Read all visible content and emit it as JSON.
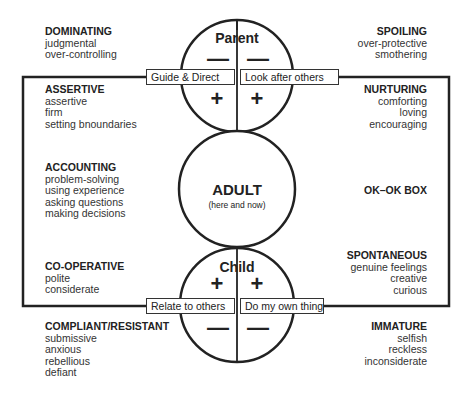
{
  "parent": {
    "label": "Parent",
    "left_label": "Guide & Direct",
    "right_label": "Look after others",
    "top_left_sign": "—",
    "top_right_sign": "—",
    "bottom_left_sign": "+",
    "bottom_right_sign": "+"
  },
  "adult": {
    "label": "ADULT",
    "sublabel": "(here and now)"
  },
  "child": {
    "label": "Child",
    "left_label": "Relate to others",
    "right_label": "Do my own thing",
    "top_left_sign": "+",
    "top_right_sign": "+",
    "bottom_left_sign": "—",
    "bottom_right_sign": "—"
  },
  "box_label": "OK–OK BOX",
  "blocks": {
    "dominating": {
      "title": "DOMINATING",
      "items": [
        "judgmental",
        "over-controlling"
      ]
    },
    "spoiling": {
      "title": "SPOILING",
      "items": [
        "over-protective",
        "smothering"
      ]
    },
    "assertive": {
      "title": "ASSERTIVE",
      "items": [
        "assertive",
        "firm",
        "setting bnoundaries"
      ]
    },
    "nurturing": {
      "title": "NURTURING",
      "items": [
        "comforting",
        "loving",
        "encouraging"
      ]
    },
    "accounting": {
      "title": "ACCOUNTING",
      "items": [
        "problem-solving",
        "using experience",
        "asking questions",
        "making decisions"
      ]
    },
    "cooperative": {
      "title": "CO-OPERATIVE",
      "items": [
        "polite",
        "considerate"
      ]
    },
    "spontaneous": {
      "title": "SPONTANEOUS",
      "items": [
        "genuine feelings",
        "creative",
        "curious"
      ]
    },
    "compliant": {
      "title": "COMPLIANT/RESISTANT",
      "items": [
        "submissive",
        "anxious",
        "rebellious",
        "defiant"
      ]
    },
    "immature": {
      "title": "IMMATURE",
      "items": [
        "selfish",
        "reckless",
        "inconsiderate"
      ]
    }
  },
  "colors": {
    "stroke": "#222222",
    "text": "#333333",
    "background": "#ffffff"
  }
}
